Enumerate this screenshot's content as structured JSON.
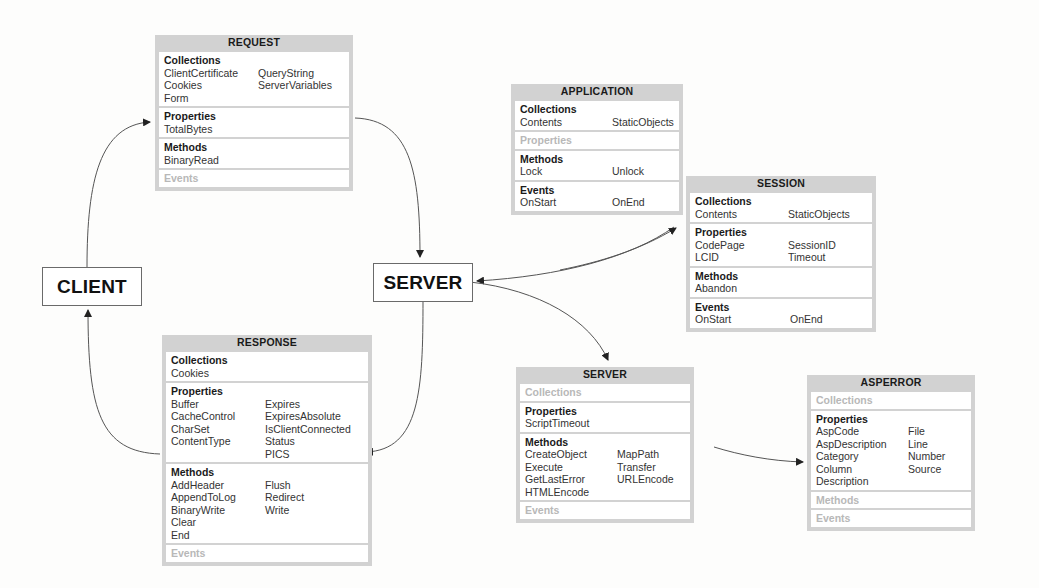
{
  "nodes": {
    "client": "CLIENT",
    "server": "SERVER"
  },
  "objects": {
    "request": {
      "title": "REQUEST",
      "sections": [
        {
          "name": "Collections",
          "col1": [
            "ClientCertificate",
            "Cookies",
            "Form"
          ],
          "col2": [
            "QueryString",
            "ServerVariables"
          ]
        },
        {
          "name": "Properties",
          "col1": [
            "TotalBytes"
          ],
          "col2": []
        },
        {
          "name": "Methods",
          "col1": [
            "BinaryRead"
          ],
          "col2": []
        },
        {
          "name": "Events",
          "col1": [],
          "col2": [],
          "empty": true
        }
      ]
    },
    "response": {
      "title": "RESPONSE",
      "sections": [
        {
          "name": "Collections",
          "col1": [
            "Cookies"
          ],
          "col2": []
        },
        {
          "name": "Properties",
          "col1": [
            "Buffer",
            "CacheControl",
            "CharSet",
            "ContentType"
          ],
          "col2": [
            "Expires",
            "ExpiresAbsolute",
            "IsClientConnected",
            "Status",
            "PICS"
          ]
        },
        {
          "name": "Methods",
          "col1": [
            "AddHeader",
            "AppendToLog",
            "BinaryWrite",
            "Clear",
            "End"
          ],
          "col2": [
            "Flush",
            "Redirect",
            "Write"
          ]
        },
        {
          "name": "Events",
          "col1": [],
          "col2": [],
          "empty": true
        }
      ]
    },
    "application": {
      "title": "APPLICATION",
      "sections": [
        {
          "name": "Collections",
          "col1": [
            "Contents"
          ],
          "col2": [
            "StaticObjects"
          ]
        },
        {
          "name": "Properties",
          "col1": [],
          "col2": [],
          "empty": true
        },
        {
          "name": "Methods",
          "col1": [
            "Lock"
          ],
          "col2": [
            "Unlock"
          ]
        },
        {
          "name": "Events",
          "col1": [
            "OnStart"
          ],
          "col2": [
            "OnEnd"
          ]
        }
      ]
    },
    "session": {
      "title": "SESSION",
      "sections": [
        {
          "name": "Collections",
          "col1": [
            "Contents"
          ],
          "col2": [
            "StaticObjects"
          ]
        },
        {
          "name": "Properties",
          "col1": [
            "CodePage",
            "LCID"
          ],
          "col2": [
            "SessionID",
            "Timeout"
          ]
        },
        {
          "name": "Methods",
          "col1": [
            "Abandon"
          ],
          "col2": []
        },
        {
          "name": "Events",
          "col1": [
            "OnStart"
          ],
          "col2": [
            "OnEnd"
          ]
        }
      ]
    },
    "server": {
      "title": "SERVER",
      "sections": [
        {
          "name": "Collections",
          "col1": [],
          "col2": [],
          "empty": true
        },
        {
          "name": "Properties",
          "col1": [
            "ScriptTimeout"
          ],
          "col2": []
        },
        {
          "name": "Methods",
          "col1": [
            "CreateObject",
            "Execute",
            "GetLastError",
            "HTMLEncode"
          ],
          "col2": [
            "MapPath",
            "Transfer",
            "URLEncode"
          ]
        },
        {
          "name": "Events",
          "col1": [],
          "col2": [],
          "empty": true
        }
      ]
    },
    "asperror": {
      "title": "ASPERROR",
      "sections": [
        {
          "name": "Collections",
          "col1": [],
          "col2": [],
          "empty": true
        },
        {
          "name": "Properties",
          "col1": [
            "AspCode",
            "AspDescription",
            "Category",
            "Column",
            "Description"
          ],
          "col2": [
            "File",
            "Line",
            "Number",
            "Source"
          ]
        },
        {
          "name": "Methods",
          "col1": [],
          "col2": [],
          "empty": true
        },
        {
          "name": "Events",
          "col1": [],
          "col2": [],
          "empty": true
        }
      ]
    }
  },
  "colors": {
    "box_frame": "#d2d2d2",
    "line": "#555555",
    "empty_heading": "#b8b8b8"
  }
}
